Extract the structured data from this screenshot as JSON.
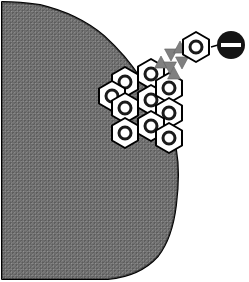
{
  "figure": {
    "background_color": "#ffffff",
    "width": 249,
    "height": 282
  },
  "cell_body": {
    "name": "cell-body-blob",
    "fill_pattern": "stippled-grey-dither",
    "fill_color": "#7a7a7a",
    "dot_color": "#4a4a4a",
    "outline_color": "#000000",
    "outline_width": 2,
    "path": "M 2 2 L 2 279 L 108 279 Q 140 276 158 256 Q 172 238 176 205 Q 180 172 176 150 Q 170 126 160 110 Q 150 94 140 78 Q 126 56 104 36 Q 78 14 40 5 Q 20 2 2 2 Z"
  },
  "hexagon_cluster": {
    "name": "receptor-hexagon-cluster",
    "count": 10,
    "hex_fill": "#ffffff",
    "hex_stroke": "#000000",
    "hex_stroke_width": 2,
    "inner_ring_stroke": "#1a1a1a",
    "inner_ring_width": 3,
    "hex_radius": 15,
    "inner_radius": 6,
    "items": [
      {
        "label": "hex-1",
        "cx": 151,
        "cy": 74
      },
      {
        "label": "hex-2",
        "cx": 125,
        "cy": 82
      },
      {
        "label": "hex-3",
        "cx": 112,
        "cy": 96
      },
      {
        "label": "hex-4",
        "cx": 151,
        "cy": 100
      },
      {
        "label": "hex-5",
        "cx": 125,
        "cy": 108
      },
      {
        "label": "hex-6",
        "cx": 169,
        "cy": 88
      },
      {
        "label": "hex-7",
        "cx": 169,
        "cy": 113
      },
      {
        "label": "hex-8",
        "cx": 151,
        "cy": 126
      },
      {
        "label": "hex-9",
        "cx": 125,
        "cy": 133
      },
      {
        "label": "hex-10",
        "cx": 169,
        "cy": 138
      }
    ]
  },
  "free_receptor": {
    "name": "free-receptor-hexagon",
    "cx": 196,
    "cy": 47,
    "radius": 15,
    "fill": "#ffffff",
    "stroke": "#000000",
    "inner_ring_stroke": "#1a1a1a",
    "inner_radius": 6
  },
  "ligand": {
    "name": "ligand-black-disc",
    "cx": 231,
    "cy": 45,
    "radius": 14,
    "fill": "#141414",
    "bar_color": "#ffffff",
    "bar_width": 20,
    "bar_height": 4
  },
  "connector": {
    "name": "ligand-connector-line",
    "x1": 211,
    "y1": 47,
    "x2": 218,
    "y2": 45,
    "stroke": "#000000",
    "stroke_width": 1.5
  },
  "signal_trail": {
    "name": "signal-triangle-trail",
    "fill": "#808080",
    "stroke": "#606060",
    "size": 7,
    "triangles": [
      {
        "label": "tri-1",
        "cx": 161,
        "cy": 63,
        "dir": "up"
      },
      {
        "label": "tri-2",
        "cx": 171,
        "cy": 54,
        "dir": "down"
      },
      {
        "label": "tri-3",
        "cx": 170,
        "cy": 67,
        "dir": "down"
      },
      {
        "label": "tri-4",
        "cx": 180,
        "cy": 48,
        "dir": "up"
      },
      {
        "label": "tri-5",
        "cx": 182,
        "cy": 62,
        "dir": "down"
      },
      {
        "label": "tri-6",
        "cx": 174,
        "cy": 74,
        "dir": "up"
      }
    ]
  },
  "legend": {
    "hexagon_meaning": "receptor",
    "disc_meaning": "ligand",
    "triangle_meaning": "signal"
  }
}
